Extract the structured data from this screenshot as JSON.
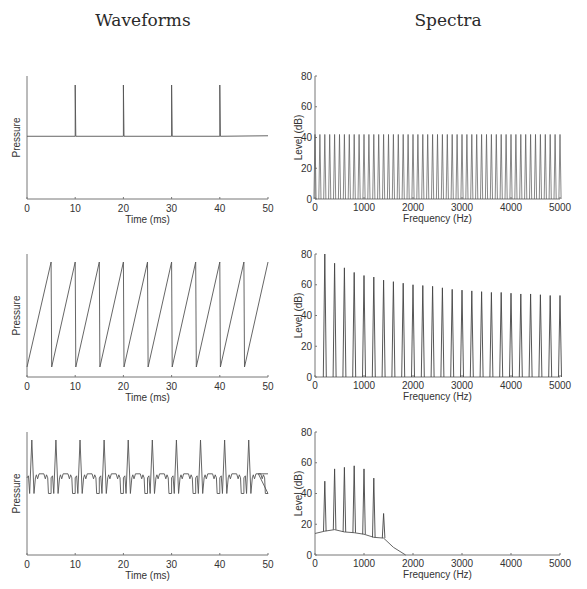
{
  "titles": {
    "left": "Waveforms",
    "right": "Spectra"
  },
  "chart_data": [
    {
      "id": "waveform-impulse-train",
      "type": "line",
      "title": "",
      "xlabel": "Time (ms)",
      "ylabel": "Pressure",
      "xlim": [
        0,
        50
      ],
      "xticks": [
        0,
        10,
        20,
        30,
        40,
        50
      ],
      "description": "Impulse train: flat baseline with impulses every 10 ms",
      "impulse_times_ms": [
        10,
        20,
        30,
        40
      ],
      "baseline_level": 0.5,
      "impulse_level": 1.0
    },
    {
      "id": "spectrum-impulse-train",
      "type": "bar",
      "xlabel": "Frequency (Hz)",
      "ylabel": "Level (dB)",
      "xlim": [
        0,
        5000
      ],
      "ylim": [
        0,
        80
      ],
      "xticks": [
        0,
        1000,
        2000,
        3000,
        4000,
        5000
      ],
      "yticks": [
        0,
        20,
        40,
        60,
        80
      ],
      "harmonic_spacing_hz": 100,
      "level_db": 42,
      "description": "Flat harmonic spectrum, harmonics every 100 Hz at ~42 dB"
    },
    {
      "id": "waveform-sawtooth",
      "type": "line",
      "xlabel": "Time (ms)",
      "ylabel": "Pressure",
      "xlim": [
        0,
        50
      ],
      "xticks": [
        0,
        10,
        20,
        30,
        40,
        50
      ],
      "period_ms": 5,
      "description": "Sawtooth wave, period 5 ms (200 Hz), rising ramps with sharp drops"
    },
    {
      "id": "spectrum-sawtooth",
      "type": "bar",
      "xlabel": "Frequency (Hz)",
      "ylabel": "Level (dB)",
      "xlim": [
        0,
        5000
      ],
      "ylim": [
        0,
        80
      ],
      "xticks": [
        0,
        1000,
        2000,
        3000,
        4000,
        5000
      ],
      "yticks": [
        0,
        20,
        40,
        60,
        80
      ],
      "harmonics_hz": [
        200,
        400,
        600,
        800,
        1000,
        1200,
        1400,
        1600,
        1800,
        2000,
        2200,
        2400,
        2600,
        2800,
        3000,
        3200,
        3400,
        3600,
        3800,
        4000,
        4200,
        4400,
        4600,
        4800,
        5000
      ],
      "levels_db": [
        80,
        74,
        71,
        68,
        66,
        65,
        63,
        62,
        61,
        60,
        59.5,
        59,
        58,
        57,
        56.5,
        56,
        55.5,
        55,
        55,
        54.5,
        54,
        54,
        53.5,
        53,
        53
      ]
    },
    {
      "id": "waveform-complex",
      "type": "line",
      "xlabel": "Time (ms)",
      "ylabel": "Pressure",
      "xlim": [
        0,
        50
      ],
      "xticks": [
        0,
        10,
        20,
        30,
        40,
        50
      ],
      "period_ms": 5,
      "description": "Periodic complex wave (200 Hz) with large positive peak, negative troughs and small ripples"
    },
    {
      "id": "spectrum-complex",
      "type": "bar",
      "xlabel": "Frequency (Hz)",
      "ylabel": "Level (dB)",
      "xlim": [
        0,
        5000
      ],
      "ylim": [
        0,
        80
      ],
      "xticks": [
        0,
        1000,
        2000,
        3000,
        4000,
        5000
      ],
      "yticks": [
        0,
        20,
        40,
        60,
        80
      ],
      "harmonics_hz": [
        200,
        400,
        600,
        800,
        1000,
        1200,
        1400
      ],
      "levels_db": [
        48,
        56,
        57,
        58,
        56,
        50,
        27
      ],
      "noise_floor": {
        "x": [
          0,
          200,
          400,
          600,
          800,
          1000,
          1200,
          1400,
          1600,
          1850
        ],
        "y": [
          14,
          15.5,
          16.5,
          15,
          14.5,
          13.5,
          11.5,
          11,
          5,
          0
        ]
      }
    }
  ],
  "axes_labels": {
    "time": "Time (ms)",
    "pressure": "Pressure",
    "freq": "Frequency (Hz)",
    "level": "Level (dB)"
  },
  "ticks": {
    "time": [
      "0",
      "10",
      "20",
      "30",
      "40",
      "50"
    ],
    "freq": [
      "0",
      "1000",
      "2000",
      "3000",
      "4000",
      "5000"
    ],
    "level": [
      "0",
      "20",
      "40",
      "60",
      "80"
    ]
  }
}
